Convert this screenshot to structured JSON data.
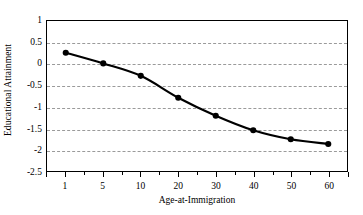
{
  "chart_data": {
    "type": "line",
    "title": "",
    "xlabel": "Age-at-Immigration",
    "ylabel": "Educational Attainment",
    "categories": [
      "1",
      "5",
      "10",
      "20",
      "30",
      "40",
      "50",
      "60"
    ],
    "values": [
      0.26,
      0.01,
      -0.28,
      -0.79,
      -1.21,
      -1.55,
      -1.76,
      -1.87
    ],
    "series": [
      {
        "name": "Educational Attainment",
        "values": [
          0.26,
          0.01,
          -0.28,
          -0.79,
          -1.21,
          -1.55,
          -1.76,
          -1.87
        ]
      }
    ],
    "ylim": [
      -2.5,
      1
    ],
    "yticks": [
      1,
      0.5,
      0,
      -0.5,
      -1,
      -1.5,
      -2,
      -2.5
    ],
    "ytick_labels": [
      "1",
      "0.5",
      "0",
      "-0.5",
      "-1",
      "-1.5",
      "-2",
      "-2.5"
    ],
    "grid": true,
    "grid_axis": "y",
    "legend": "none",
    "marker": "filled-circle",
    "line_color": "#000000",
    "marker_color": "#000000",
    "grid_color": "#9a9a9a",
    "plot_border_color": "#000000",
    "background_color": "#ffffff",
    "x_scale": "categorical"
  }
}
